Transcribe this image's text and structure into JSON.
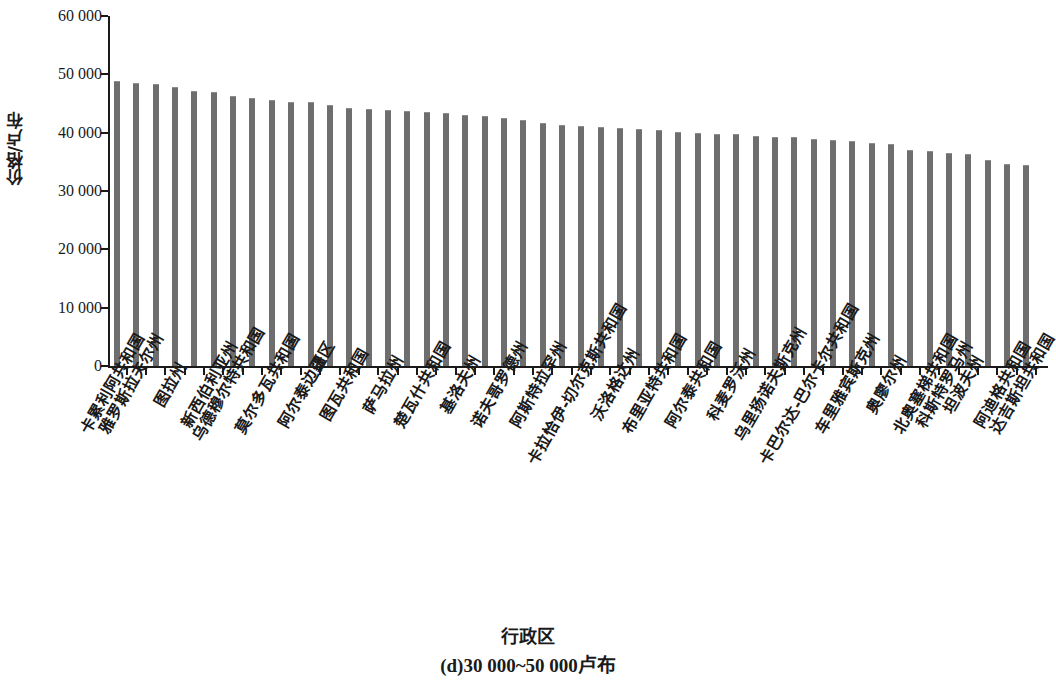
{
  "chart_data": {
    "type": "bar",
    "title": "",
    "xlabel": "行政区",
    "ylabel": "价格/卢布",
    "caption": "(d)30 000~50 000卢布",
    "ylim": [
      0,
      60000
    ],
    "ytick_labels": [
      "0",
      "10 000",
      "20 000",
      "30 000",
      "40 000",
      "50 000",
      "60 000"
    ],
    "ytick_values": [
      0,
      10000,
      20000,
      30000,
      40000,
      50000,
      60000
    ],
    "grid": false,
    "legend": null,
    "bar_color": "#6e6e6e",
    "axis_color": "#1a1a1a",
    "background_color": "#ffffff",
    "bar_count": 48,
    "categories": [
      "卡累利阿共和国",
      "雅罗斯拉夫尔州",
      "",
      "图拉州",
      "",
      "新西伯利亚州",
      "乌德穆尔特共和国",
      "",
      "莫尔多瓦共和国",
      "",
      "阿尔泰边疆区",
      "",
      "图瓦共和国",
      "",
      "萨马拉州",
      "",
      "楚瓦什共和国",
      "",
      "基洛夫州",
      "",
      "诺夫哥罗德州",
      "",
      "阿斯特拉罕州",
      "",
      "卡拉恰伊-切尔克斯共和国",
      "",
      "沃洛格达州",
      "",
      "布里亚特共和国",
      "",
      "阿尔泰共和国",
      "",
      "科麦罗沃州",
      "",
      "乌里扬诺夫斯克州",
      "",
      "卡巴尔达-巴尔卡尔共和国",
      "",
      "车里雅宾斯克州",
      "",
      "奥廖尔州",
      "",
      "北奥塞梯共和国",
      "科斯特罗马州",
      "坦波夫州",
      "",
      "阿迪格共和国",
      "达吉斯坦共和国"
    ],
    "values": [
      48900,
      48500,
      48400,
      47900,
      47100,
      46900,
      46300,
      45900,
      45600,
      45300,
      45200,
      44800,
      44300,
      44100,
      43900,
      43700,
      43600,
      43400,
      43100,
      42900,
      42600,
      42100,
      41700,
      41400,
      41200,
      41000,
      40800,
      40600,
      40400,
      40200,
      40000,
      39800,
      39700,
      39400,
      39300,
      39200,
      38900,
      38700,
      38500,
      38200,
      38000,
      37100,
      36900,
      36500,
      36400,
      35400,
      34600,
      34400
    ],
    "tail_values": [
      31300,
      28900
    ],
    "value_unit": "卢布",
    "y_value_min": 28900,
    "y_value_max": 48900
  },
  "x_axis_labels_visible": [
    {
      "index": 0,
      "text": "卡累利阿共和国"
    },
    {
      "index": 1,
      "text": "雅罗斯拉夫尔州"
    },
    {
      "index": 3,
      "text": "图拉州"
    },
    {
      "index": 5,
      "text": "新西伯利亚州"
    },
    {
      "index": 6,
      "text": "乌德穆尔特共和国"
    },
    {
      "index": 8,
      "text": "莫尔多瓦共和国"
    },
    {
      "index": 10,
      "text": "阿尔泰边疆区"
    },
    {
      "index": 12,
      "text": "图瓦共和国"
    },
    {
      "index": 14,
      "text": "萨马拉州"
    },
    {
      "index": 16,
      "text": "楚瓦什共和国"
    },
    {
      "index": 18,
      "text": "基洛夫州"
    },
    {
      "index": 20,
      "text": "诺夫哥罗德州"
    },
    {
      "index": 22,
      "text": "阿斯特拉罕州"
    },
    {
      "index": 24,
      "text": "卡拉恰伊-切尔克斯共和国"
    },
    {
      "index": 26,
      "text": "沃洛格达州"
    },
    {
      "index": 28,
      "text": "布里亚特共和国"
    },
    {
      "index": 30,
      "text": "阿尔泰共和国"
    },
    {
      "index": 32,
      "text": "科麦罗沃州"
    },
    {
      "index": 34,
      "text": "乌里扬诺夫斯克州"
    },
    {
      "index": 36,
      "text": "卡巴尔达-巴尔卡尔共和国"
    },
    {
      "index": 38,
      "text": "车里雅宾斯克州"
    },
    {
      "index": 40,
      "text": "奥廖尔州"
    },
    {
      "index": 42,
      "text": "北奥塞梯共和国"
    },
    {
      "index": 43,
      "text": "科斯特罗马州"
    },
    {
      "index": 44,
      "text": "坦波夫州"
    },
    {
      "index": 46,
      "text": "阿迪格共和国"
    },
    {
      "index": 47,
      "text": "达吉斯坦共和国"
    }
  ]
}
